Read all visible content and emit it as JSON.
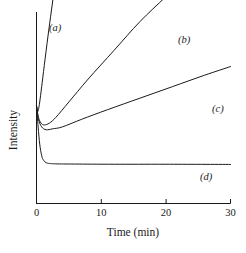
{
  "chart_data": {
    "type": "line",
    "title": "",
    "subtitle": "",
    "xlabel": "Time (min)",
    "ylabel": "Intensity",
    "xlim": [
      0,
      30
    ],
    "ylim": [
      0,
      1
    ],
    "xticks": [
      0,
      10,
      20,
      30
    ],
    "xticklabels": [
      "0",
      "10",
      "20",
      "30"
    ],
    "yticks": [],
    "yticklabels": [],
    "grid": false,
    "legend_position": "inline-end-labels",
    "annotations": [
      "(a)",
      "(b)",
      "(c)",
      "(d)"
    ],
    "series": [
      {
        "name": "(a)",
        "label": "(a)",
        "x": [
          0.0,
          0.15,
          0.3,
          0.5,
          0.8,
          1.2,
          1.8,
          2.6,
          3.6,
          4.8,
          6.2,
          7.6
        ],
        "y": [
          0.51,
          0.48,
          0.49,
          0.53,
          0.61,
          0.72,
          0.88,
          1.08,
          1.32,
          1.58,
          1.86,
          2.12
        ]
      },
      {
        "name": "(b)",
        "label": "(b)",
        "x": [
          0.0,
          0.3,
          0.7,
          1.2,
          2.0,
          3.0,
          5.0,
          8.0,
          12.0,
          16.0,
          20.0,
          24.0,
          24.7
        ],
        "y": [
          0.51,
          0.45,
          0.42,
          0.41,
          0.42,
          0.45,
          0.53,
          0.65,
          0.8,
          0.95,
          1.08,
          1.21,
          1.23
        ]
      },
      {
        "name": "(c)",
        "label": "(c)",
        "x": [
          0.0,
          0.3,
          0.8,
          1.5,
          2.5,
          4.0,
          7.0,
          11.0,
          16.0,
          21.0,
          26.0,
          30.0
        ],
        "y": [
          0.51,
          0.44,
          0.4,
          0.385,
          0.39,
          0.4,
          0.44,
          0.49,
          0.55,
          0.61,
          0.67,
          0.715
        ]
      },
      {
        "name": "(d)",
        "label": "(d)",
        "x": [
          0.0,
          0.25,
          0.5,
          0.8,
          1.1,
          1.5,
          2.0,
          3.0,
          6.0,
          12.0,
          20.0,
          30.0
        ],
        "y": [
          0.51,
          0.4,
          0.31,
          0.25,
          0.225,
          0.213,
          0.209,
          0.207,
          0.206,
          0.205,
          0.205,
          0.204
        ]
      }
    ],
    "colors": {
      "line": "#1a1a1a",
      "axis": "#1a1a1a",
      "background": "#ffffff"
    }
  }
}
